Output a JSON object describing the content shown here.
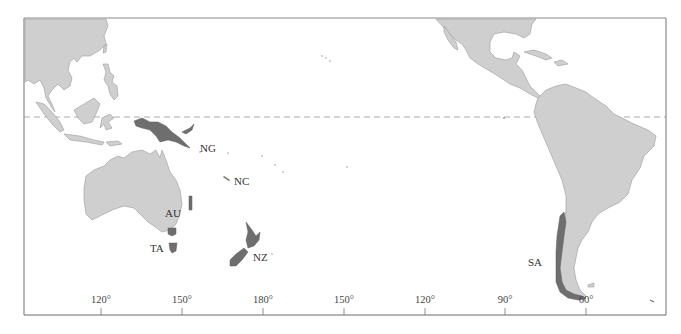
{
  "map": {
    "colors": {
      "land": "#cfcfcf",
      "land_stroke": "#9a9a9a",
      "highlight": "#6e6e6e",
      "frame": "#8a8a8a",
      "equator": "#9a9a9a"
    },
    "equator_line": "dashed",
    "region_labels": [
      {
        "code": "NG",
        "x": 200,
        "y": 143
      },
      {
        "code": "NC",
        "x": 234,
        "y": 176
      },
      {
        "code": "AU",
        "x": 165,
        "y": 208
      },
      {
        "code": "TA",
        "x": 150,
        "y": 243
      },
      {
        "code": "NZ",
        "x": 253,
        "y": 252
      },
      {
        "code": "SA",
        "x": 528,
        "y": 257
      }
    ],
    "longitude_ticks": [
      {
        "label": "120°",
        "x": 101
      },
      {
        "label": "150°",
        "x": 182
      },
      {
        "label": "180°",
        "x": 263
      },
      {
        "label": "150°",
        "x": 344
      },
      {
        "label": "120°",
        "x": 425
      },
      {
        "label": "90°",
        "x": 505
      },
      {
        "label": "60°",
        "x": 586
      }
    ]
  }
}
